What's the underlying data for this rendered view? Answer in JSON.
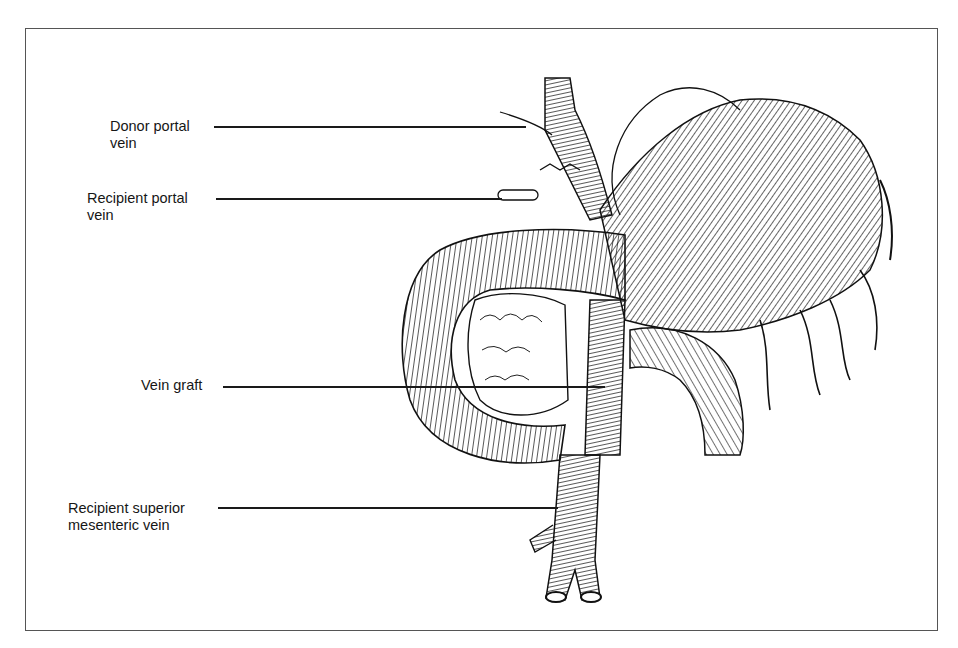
{
  "figure": {
    "type": "anatomical line illustration",
    "labels": [
      {
        "id": "donor-portal-vein",
        "line1": "Donor portal",
        "line2": "vein"
      },
      {
        "id": "recipient-portal-vein",
        "line1": "Recipient portal",
        "line2": "vein"
      },
      {
        "id": "vein-graft",
        "line1": "Vein graft",
        "line2": ""
      },
      {
        "id": "recipient-smv",
        "line1": "Recipient superior",
        "line2": "mesenteric vein"
      }
    ]
  }
}
